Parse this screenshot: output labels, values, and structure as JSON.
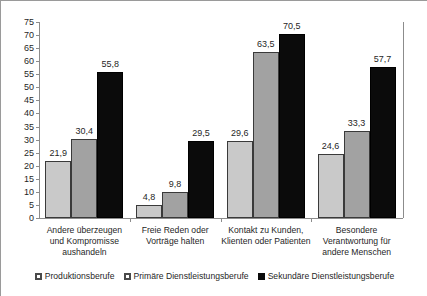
{
  "chart_data": {
    "type": "bar",
    "title": "",
    "subtitle": "",
    "xlabel": "",
    "ylabel": "",
    "ylim": [
      0,
      75
    ],
    "ytick_step": 5,
    "yticks": [
      75,
      70,
      65,
      60,
      55,
      50,
      45,
      40,
      35,
      30,
      25,
      20,
      15,
      10,
      5,
      0
    ],
    "grid": false,
    "legend_position": "bottom",
    "categories": [
      "Andere überzeugen und Kompromisse aushandeln",
      "Freie Reden oder Vorträge halten",
      "Kontakt zu Kunden, Klienten oder Patienten",
      "Besondere Verantwortung für andere Menschen"
    ],
    "series": [
      {
        "name": "Produktionsberufe",
        "color": "#c9c9c9",
        "values": [
          21.9,
          4.8,
          29.6,
          24.6
        ]
      },
      {
        "name": "Primäre Dienstleistungsberufe",
        "color": "#a2a2a2",
        "values": [
          30.4,
          9.8,
          63.5,
          33.3
        ]
      },
      {
        "name": "Sekundäre Dienstleistungsberufe",
        "color": "#0b0b0b",
        "values": [
          55.8,
          29.5,
          70.5,
          57.7
        ]
      }
    ],
    "value_labels": [
      [
        "21,9",
        "30,4",
        "55,8"
      ],
      [
        "4,8",
        "9,8",
        "29,5"
      ],
      [
        "29,6",
        "63,5",
        "70,5"
      ],
      [
        "24,6",
        "33,3",
        "57,7"
      ]
    ],
    "category_label_lines": [
      [
        "Andere überzeugen",
        "und Kompromisse",
        "aushandeln"
      ],
      [
        "Freie Reden oder",
        "Vorträge halten"
      ],
      [
        "Kontakt zu Kunden,",
        "Klienten oder Patienten"
      ],
      [
        "Besondere",
        "Verantwortung für",
        "andere Menschen"
      ]
    ]
  }
}
